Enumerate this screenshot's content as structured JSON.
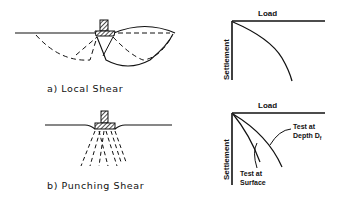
{
  "panels": [
    {
      "id": "a",
      "caption": "a) Local   Shear",
      "graph": {
        "x_axis_label": "Load",
        "y_axis_label": "Settlement"
      }
    },
    {
      "id": "b",
      "caption": "b) Punching   Shear",
      "graph": {
        "x_axis_label": "Load",
        "y_axis_label": "Settlement",
        "annotations": {
          "depth_line1": "Test at",
          "depth_line2": "Depth  D",
          "depth_subscript": "f",
          "surface_line1": "Test at",
          "surface_line2": "Surface"
        }
      }
    }
  ]
}
